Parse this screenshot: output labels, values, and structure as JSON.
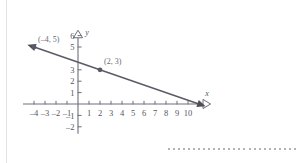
{
  "figure": {
    "background_color": "#ffffff",
    "axis_color": "#6e6e7a",
    "line_color": "#5b5b66",
    "label_color": "#55555f"
  },
  "axes": {
    "x_axis_name": "x",
    "y_axis_name": "y",
    "x_arrow_icon": "hollow-triangle-right",
    "y_arrow_icon": "hollow-triangle-up"
  },
  "decoration": {
    "dot_count": 26,
    "dot_color": "#9a9a9a"
  },
  "chart_data": {
    "type": "line",
    "title": "",
    "xlabel": "x",
    "ylabel": "y",
    "xlim": [
      -5,
      12
    ],
    "ylim": [
      -2.6,
      6.6
    ],
    "grid": false,
    "legend": "none",
    "x_ticks": [
      -4,
      -3,
      -2,
      -1,
      1,
      2,
      3,
      4,
      5,
      6,
      7,
      8,
      9,
      10
    ],
    "x_tick_labels": [
      "–4",
      "–3",
      "–2",
      "–1",
      "1",
      "2",
      "3",
      "4",
      "5",
      "6",
      "7",
      "8",
      "9",
      "10"
    ],
    "y_ticks": [
      -2,
      -1,
      1,
      2,
      3,
      5,
      6
    ],
    "y_tick_labels": [
      "–2",
      "–1",
      "1",
      "2",
      "3",
      "5",
      "6"
    ],
    "series": [
      {
        "name": "line",
        "slope": -0.3333,
        "intercept": 3.6667,
        "x_start": -4.6,
        "x_end": 11.6,
        "arrow_start": true,
        "arrow_end": true
      }
    ],
    "points": [
      {
        "x": -4,
        "y": 5,
        "label": "(–4, 5)"
      },
      {
        "x": 2,
        "y": 3,
        "label": "(2, 3)"
      }
    ]
  }
}
